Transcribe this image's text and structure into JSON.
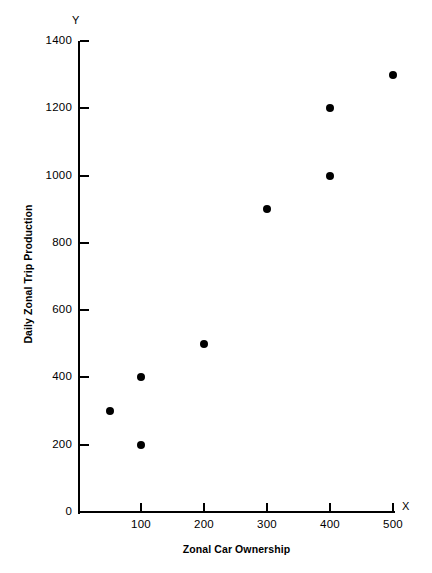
{
  "chart_data": {
    "type": "scatter",
    "title": "",
    "xlabel": "Zonal Car Ownership",
    "ylabel": "Daily Zonal Trip Production",
    "x_axis_letter": "X",
    "y_axis_letter": "Y",
    "xlim": [
      0,
      500
    ],
    "ylim": [
      0,
      1400
    ],
    "xticks": [
      100,
      200,
      300,
      400,
      500
    ],
    "xtick_labels": [
      "100",
      "200",
      "300",
      "400",
      "500"
    ],
    "yticks": [
      0,
      200,
      400,
      600,
      800,
      1000,
      1200,
      1400
    ],
    "ytick_labels": [
      "0",
      "200",
      "400",
      "600",
      "800",
      "1000",
      "1200",
      "1400"
    ],
    "grid": false,
    "legend": null,
    "marker_color": "#000000",
    "points": [
      {
        "x": 50,
        "y": 300
      },
      {
        "x": 100,
        "y": 400
      },
      {
        "x": 100,
        "y": 200
      },
      {
        "x": 200,
        "y": 500
      },
      {
        "x": 300,
        "y": 900
      },
      {
        "x": 400,
        "y": 1200
      },
      {
        "x": 400,
        "y": 1000
      },
      {
        "x": 500,
        "y": 1300
      }
    ]
  }
}
